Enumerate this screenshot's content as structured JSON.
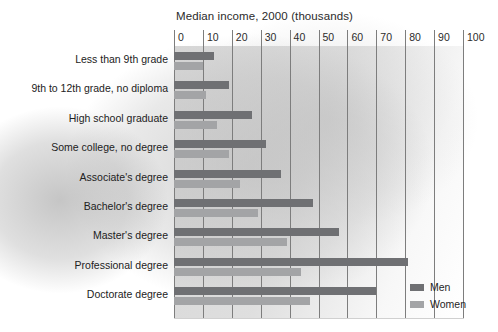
{
  "chart_data": {
    "type": "bar",
    "orientation": "horizontal",
    "title": "Median income, 2000 (thousands)",
    "xlabel": "",
    "ylabel": "",
    "xlim": [
      0,
      100
    ],
    "xticks": [
      "0",
      "10",
      "20",
      "30",
      "40",
      "50",
      "60",
      "70",
      "80",
      "90",
      "100"
    ],
    "grid": true,
    "legend_position": "bottom-right",
    "categories": [
      "Less than 9th grade",
      "9th to 12th grade, no diploma",
      "High school graduate",
      "Some college, no degree",
      "Associate's degree",
      "Bachelor's degree",
      "Master's degree",
      "Professional degree",
      "Doctorate degree"
    ],
    "series": [
      {
        "name": "Men",
        "color": "#6f7073",
        "values": [
          14,
          19,
          27,
          32,
          37,
          48,
          57,
          81,
          70
        ]
      },
      {
        "name": "Women",
        "color": "#a3a4a6",
        "values": [
          10,
          11,
          15,
          19,
          23,
          29,
          39,
          44,
          47
        ]
      }
    ]
  },
  "legend": {
    "items": [
      {
        "label": "Men",
        "color": "#6f7073"
      },
      {
        "label": "Women",
        "color": "#a3a4a6"
      }
    ]
  }
}
